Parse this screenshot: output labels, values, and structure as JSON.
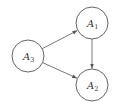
{
  "diagram": {
    "type": "directed-graph",
    "colors": {
      "stroke": "#555555",
      "text": "#333333",
      "background": "#ffffff"
    },
    "nodes": [
      {
        "id": "A3",
        "base": "A",
        "sub": "3",
        "cx": 28,
        "cy": 56,
        "r": 16
      },
      {
        "id": "A1",
        "base": "A",
        "sub": "1",
        "cx": 92,
        "cy": 23,
        "r": 16
      },
      {
        "id": "A2",
        "base": "A",
        "sub": "2",
        "cx": 92,
        "cy": 85,
        "r": 16
      }
    ],
    "edges": [
      {
        "from": "A3",
        "to": "A1"
      },
      {
        "from": "A1",
        "to": "A2"
      },
      {
        "from": "A3",
        "to": "A2"
      }
    ]
  }
}
